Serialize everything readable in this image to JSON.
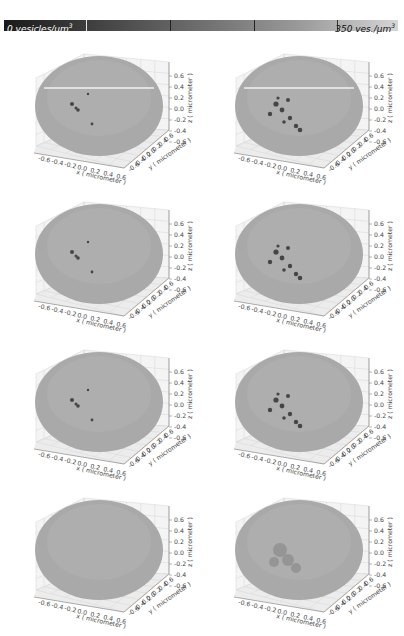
{
  "colorbar": {
    "min_label": "0 vesicles/µm",
    "min_sup": "3",
    "max_label": "350 ves./µm",
    "max_sup": "3",
    "gradient": [
      "#1a1a1a",
      "#d6d6d6"
    ]
  },
  "chart_data": {
    "type": "scatter3d",
    "layout": {
      "rows": 4,
      "cols": 2,
      "grid": true
    },
    "colorbar": {
      "min": 0,
      "max": 350,
      "unit": "vesicles/µm³"
    },
    "panels": [
      {
        "row": 1,
        "col": 1,
        "xlabel": "x ( micrometer )",
        "ylabel": "y ( micrometer )",
        "zlabel": "z ( micrometer )",
        "xticks": [
          "-0.6",
          "-0.4",
          "-0.2",
          "0.0",
          "0.2",
          "0.4",
          "0.6"
        ],
        "yticks": [
          "-0.6",
          "-0.4",
          "-0.2",
          "0.0",
          "0.2",
          "0.4",
          "0.6"
        ],
        "zticks": [
          "0.6",
          "0.4",
          "0.2",
          "0.0",
          "-0.2",
          "-0.4",
          "-0.6"
        ],
        "xlim": [
          -0.6,
          0.6
        ],
        "ylim": [
          -0.6,
          0.6
        ],
        "zlim": [
          -0.6,
          0.6
        ],
        "dark_cluster": "small",
        "equator_line": true
      },
      {
        "row": 1,
        "col": 2,
        "xlabel": "x ( micrometer )",
        "ylabel": "y ( micrometer )",
        "zlabel": "z ( micrometer )",
        "xticks": [
          "-0.6",
          "-0.4",
          "-0.2",
          "0.0",
          "0.2",
          "0.4",
          "0.6"
        ],
        "yticks": [
          "-0.6",
          "-0.4",
          "-0.2",
          "0.0",
          "0.2",
          "0.4",
          "0.6"
        ],
        "zticks": [
          "0.6",
          "0.4",
          "0.2",
          "0.0",
          "-0.2",
          "-0.4",
          "-0.6"
        ],
        "xlim": [
          -0.6,
          0.6
        ],
        "ylim": [
          -0.6,
          0.6
        ],
        "zlim": [
          -0.6,
          0.6
        ],
        "dark_cluster": "large",
        "equator_line": true
      },
      {
        "row": 2,
        "col": 1,
        "xlabel": "x ( micrometer )",
        "ylabel": "y ( micrometer )",
        "zlabel": "z ( micrometer )",
        "xticks": [
          "-0.6",
          "-0.4",
          "-0.2",
          "0.0",
          "0.2",
          "0.4",
          "0.6"
        ],
        "yticks": [
          "-0.6",
          "-0.4",
          "-0.2",
          "0.0",
          "0.2",
          "0.4",
          "0.6"
        ],
        "zticks": [
          "0.6",
          "0.4",
          "0.2",
          "0.0",
          "-0.2",
          "-0.4",
          "-0.6"
        ],
        "xlim": [
          -0.6,
          0.6
        ],
        "ylim": [
          -0.6,
          0.6
        ],
        "zlim": [
          -0.6,
          0.6
        ],
        "dark_cluster": "small",
        "equator_line": false
      },
      {
        "row": 2,
        "col": 2,
        "xlabel": "x ( micrometer )",
        "ylabel": "y ( micrometer )",
        "zlabel": "z ( micrometer )",
        "xticks": [
          "-0.6",
          "-0.4",
          "-0.2",
          "0.0",
          "0.2",
          "0.4",
          "0.6"
        ],
        "yticks": [
          "-0.6",
          "-0.4",
          "-0.2",
          "0.0",
          "0.2",
          "0.4",
          "0.6"
        ],
        "zticks": [
          "0.6",
          "0.4",
          "0.2",
          "0.0",
          "-0.2",
          "-0.4",
          "-0.6"
        ],
        "xlim": [
          -0.6,
          0.6
        ],
        "ylim": [
          -0.6,
          0.6
        ],
        "zlim": [
          -0.6,
          0.6
        ],
        "dark_cluster": "large",
        "equator_line": false
      },
      {
        "row": 3,
        "col": 1,
        "xlabel": "x ( micrometer )",
        "ylabel": "y ( micrometer )",
        "zlabel": "z ( micrometer )",
        "xticks": [
          "-0.6",
          "-0.4",
          "-0.2",
          "0.0",
          "0.2",
          "0.4",
          "0.6"
        ],
        "yticks": [
          "-0.6",
          "-0.4",
          "-0.2",
          "0.0",
          "0.2",
          "0.4",
          "0.6"
        ],
        "zticks": [
          "0.6",
          "0.4",
          "0.2",
          "0.0",
          "-0.2",
          "-0.4",
          "-0.6"
        ],
        "xlim": [
          -0.6,
          0.6
        ],
        "ylim": [
          -0.6,
          0.6
        ],
        "zlim": [
          -0.6,
          0.6
        ],
        "dark_cluster": "small",
        "equator_line": false
      },
      {
        "row": 3,
        "col": 2,
        "xlabel": "x ( micrometer )",
        "ylabel": "y ( micrometer )",
        "zlabel": "z ( micrometer )",
        "xticks": [
          "-0.6",
          "-0.4",
          "-0.2",
          "0.0",
          "0.2",
          "0.4",
          "0.6"
        ],
        "yticks": [
          "-0.6",
          "-0.4",
          "-0.2",
          "0.0",
          "0.2",
          "0.4",
          "0.6"
        ],
        "zticks": [
          "0.6",
          "0.4",
          "0.2",
          "0.0",
          "-0.2",
          "-0.4",
          "-0.6"
        ],
        "xlim": [
          -0.6,
          0.6
        ],
        "ylim": [
          -0.6,
          0.6
        ],
        "zlim": [
          -0.6,
          0.6
        ],
        "dark_cluster": "large",
        "equator_line": false
      },
      {
        "row": 4,
        "col": 1,
        "xlabel": "x ( micrometer )",
        "ylabel": "y ( micrometer )",
        "zlabel": "z ( micrometer )",
        "xticks": [
          "-0.6",
          "-0.4",
          "-0.2",
          "0.0",
          "0.2",
          "0.4",
          "0.6"
        ],
        "yticks": [
          "-0.6",
          "-0.4",
          "-0.2",
          "0.0",
          "0.2",
          "0.4",
          "0.6"
        ],
        "zticks": [
          "0.6",
          "0.4",
          "0.2",
          "0.0",
          "-0.2",
          "-0.4",
          "-0.6"
        ],
        "xlim": [
          -0.6,
          0.6
        ],
        "ylim": [
          -0.6,
          0.6
        ],
        "zlim": [
          -0.6,
          0.6
        ],
        "dark_cluster": "none",
        "equator_line": false
      },
      {
        "row": 4,
        "col": 2,
        "xlabel": "x ( micrometer )",
        "ylabel": "y ( micrometer )",
        "zlabel": "z ( micrometer )",
        "xticks": [
          "-0.6",
          "-0.4",
          "-0.2",
          "0.0",
          "0.2",
          "0.4",
          "0.6"
        ],
        "yticks": [
          "-0.6",
          "-0.4",
          "-0.2",
          "0.0",
          "0.2",
          "0.4",
          "0.6"
        ],
        "zticks": [
          "0.6",
          "0.4",
          "0.2",
          "0.0",
          "-0.2",
          "-0.4",
          "-0.6"
        ],
        "xlim": [
          -0.6,
          0.6
        ],
        "ylim": [
          -0.6,
          0.6
        ],
        "zlim": [
          -0.6,
          0.6
        ],
        "dark_cluster": "diffuse",
        "equator_line": false
      }
    ]
  }
}
